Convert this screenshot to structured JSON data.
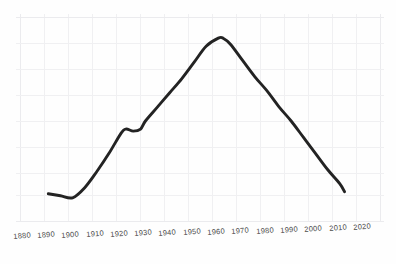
{
  "chart_data": {
    "type": "line",
    "title": "",
    "subtitle": "",
    "xlabel": "",
    "ylabel": "",
    "grid": true,
    "legend": "none",
    "xlim": [
      1880,
      2020
    ],
    "ylim": [
      0,
      100
    ],
    "x_tick_labels": [
      "1880",
      "1890",
      "1900",
      "1910",
      "1920",
      "1930",
      "1940",
      "1950",
      "1960",
      "1970",
      "1980",
      "1990",
      "2000",
      "2010",
      "2020"
    ],
    "y_tick_labels": [],
    "series": [
      {
        "name": "value",
        "x": [
          1890,
          1895,
          1900,
          1905,
          1910,
          1915,
          1920,
          1922,
          1925,
          1928,
          1930,
          1935,
          1940,
          1945,
          1950,
          1955,
          1960,
          1962,
          1965,
          1970,
          1975,
          1980,
          1985,
          1990,
          1995,
          2000,
          2005,
          2010,
          2012
        ],
        "values": [
          14,
          13,
          12,
          17,
          25,
          34,
          44,
          46,
          45,
          46,
          50,
          57,
          64,
          71,
          79,
          87,
          91,
          91,
          88,
          80,
          72,
          65,
          57,
          50,
          42,
          34,
          26,
          19,
          15
        ]
      }
    ],
    "annotations": [],
    "colors": {
      "line": "#232323",
      "grid": "#f0f0f2",
      "background": "#fefefe",
      "tick_text": "#4a4a4a"
    }
  },
  "axis": {
    "x_ticks": [
      {
        "label": "1880",
        "x": 24
      },
      {
        "label": "1890",
        "x": 48
      },
      {
        "label": "1900",
        "x": 72
      },
      {
        "label": "1910",
        "x": 96
      },
      {
        "label": "1920",
        "x": 120
      },
      {
        "label": "1930",
        "x": 145
      },
      {
        "label": "1940",
        "x": 169
      },
      {
        "label": "1950",
        "x": 193
      },
      {
        "label": "1960",
        "x": 218
      },
      {
        "label": "1970",
        "x": 242
      },
      {
        "label": "1980",
        "x": 266
      },
      {
        "label": "1990",
        "x": 291
      },
      {
        "label": "2000",
        "x": 315
      },
      {
        "label": "2010",
        "x": 339
      },
      {
        "label": "2020",
        "x": 364
      }
    ]
  }
}
